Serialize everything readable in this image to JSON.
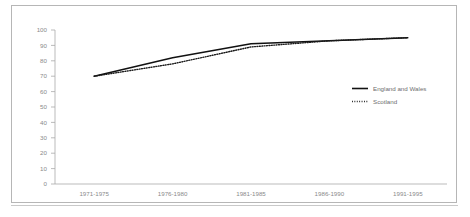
{
  "chart_data": {
    "type": "line",
    "title": "",
    "subtitle": "",
    "xlabel": "",
    "ylabel": "",
    "ylim": [
      0,
      100
    ],
    "ytick_step": 10,
    "yticks": [
      "0",
      "10",
      "20",
      "30",
      "40",
      "50",
      "60",
      "70",
      "80",
      "90",
      "100"
    ],
    "grid": false,
    "legend_position": "center-right",
    "categories": [
      "1971-1975",
      "1976-1980",
      "1981-1985",
      "1986-1990",
      "1991-1995"
    ],
    "series": [
      {
        "name": "England and Wales",
        "style": "solid",
        "color": "#111111",
        "values": [
          70,
          82,
          91,
          93,
          95
        ]
      },
      {
        "name": "Scotland",
        "style": "dotted",
        "color": "#1a1a1a",
        "values": [
          70,
          78,
          89,
          93,
          95
        ]
      }
    ]
  },
  "legend": {
    "entries": [
      {
        "label": "England and Wales"
      },
      {
        "label": "Scotland"
      }
    ]
  }
}
